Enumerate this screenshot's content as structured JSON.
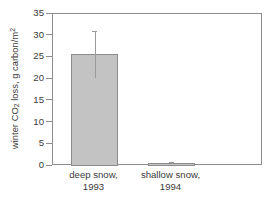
{
  "chart_data": {
    "type": "bar",
    "title": "",
    "xlabel": "",
    "ylabel": "winter CO2 loss, g carbon/m2",
    "ylabel_parts": {
      "lead": "winter CO",
      "sub": "2",
      "mid": " loss, g carbon/m",
      "sup": "2"
    },
    "categories": [
      "deep snow,\n1993",
      "shallow snow,\n1994"
    ],
    "category_lines": [
      [
        "deep snow,",
        "1993"
      ],
      [
        "shallow snow,",
        "1994"
      ]
    ],
    "values": [
      25.8,
      0.7
    ],
    "errors_low": [
      20.3,
      0.4
    ],
    "errors_high": [
      31.0,
      1.0
    ],
    "ylim": [
      0,
      35
    ],
    "yticks": [
      0,
      5,
      10,
      15,
      20,
      25,
      30,
      35
    ],
    "ytick_labels": [
      "0",
      "5",
      "10",
      "15",
      "20",
      "25",
      "30",
      "35"
    ],
    "grid": false,
    "legend": null,
    "series": [
      {
        "name": "winter CO2 loss",
        "values": [
          25.8,
          0.7
        ]
      }
    ]
  },
  "style": {
    "bar_fill": "#c3c3c3",
    "bar_edge": "#8c8c8c",
    "axis_color": "#8d8d8d",
    "error_color": "#9a9a9a",
    "text_color": "#3b3b3b",
    "background": "#ffffff"
  }
}
